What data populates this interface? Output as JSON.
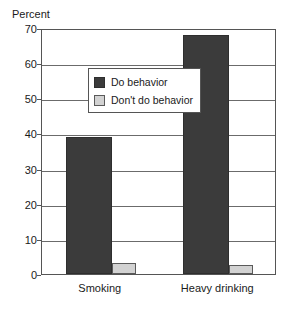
{
  "chart_data": {
    "type": "bar",
    "title": "",
    "xlabel": "",
    "ylabel": "Percent",
    "ylim": [
      0,
      70
    ],
    "yticks": [
      0,
      10,
      20,
      30,
      40,
      50,
      60,
      70
    ],
    "ytick_labels": [
      "0",
      "10",
      "20",
      "30",
      "40",
      "50",
      "60",
      "70"
    ],
    "grid": true,
    "legend_position": "upper-left-inside",
    "categories": [
      "Smoking",
      "Heavy drinking"
    ],
    "series": [
      {
        "name": "Do behavior",
        "color": "#3b3b3b",
        "values": [
          39,
          68
        ]
      },
      {
        "name": "Don't do behavior",
        "color": "#d2d2d2",
        "values": [
          3,
          2.5
        ]
      }
    ]
  },
  "legend": {
    "entries": [
      {
        "label": "Do behavior",
        "swatch": "dark-square-swatch"
      },
      {
        "label": "Don't do behavior",
        "swatch": "light-square-swatch"
      }
    ]
  },
  "axis": {
    "y_title": "Percent"
  }
}
